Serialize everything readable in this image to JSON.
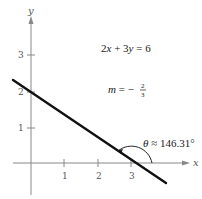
{
  "diagram": {
    "axes": {
      "x_label": "x",
      "y_label": "y",
      "x_ticks": [
        "1",
        "2",
        "3"
      ],
      "y_ticks": [
        "1",
        "2",
        "3"
      ]
    },
    "equation": {
      "lhs_a": "2",
      "x_var": "x",
      "plus": " + 3",
      "y_var": "y",
      "rhs": " = 6"
    },
    "slope": {
      "m_var": "m",
      "eq": " = −",
      "numerator": "2",
      "denominator": "3"
    },
    "angle": {
      "theta": "θ",
      "approx": " ≈ 146.31°"
    },
    "line": {
      "x_intercept": 3,
      "y_intercept": 2,
      "slope": -0.6667,
      "color": "#111111"
    },
    "colors": {
      "axis": "#888888",
      "line": "#111111",
      "text": "#222222"
    }
  }
}
